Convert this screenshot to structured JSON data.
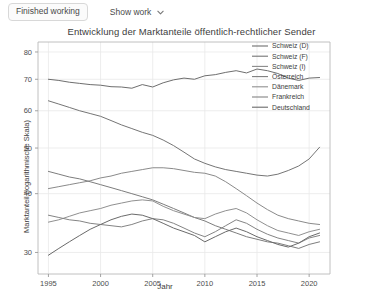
{
  "toolbar": {
    "status_label": "Finished working",
    "show_work_label": "Show work",
    "chevron_icon": "chevron-down-icon"
  },
  "chart_data": {
    "type": "line",
    "title": "Entwicklung der Marktanteile öffentlich-rechtlicher Sender",
    "xlabel": "Jahr",
    "ylabel": "Marktanteil (logarithmische Skala)",
    "yscale": "log",
    "grid": true,
    "legend_position": "top-right",
    "xlim": [
      1994,
      2022
    ],
    "ylim": [
      27,
      84
    ],
    "xticks": [
      1995,
      2000,
      2005,
      2010,
      2015,
      2020
    ],
    "yticks": [
      30,
      40,
      50,
      60,
      70,
      80
    ],
    "x": [
      1995,
      1996,
      1997,
      1998,
      1999,
      2000,
      2001,
      2002,
      2003,
      2004,
      2005,
      2006,
      2007,
      2008,
      2009,
      2010,
      2011,
      2012,
      2013,
      2014,
      2015,
      2016,
      2017,
      2018,
      2019,
      2020,
      2021
    ],
    "series": [
      {
        "name": "Schweiz (D)",
        "color": "#6e6e6e",
        "values": [
          70.0,
          69.6,
          69.0,
          68.6,
          68.2,
          68.0,
          67.5,
          67.4,
          67.0,
          68.2,
          67.4,
          68.8,
          69.8,
          70.4,
          70.0,
          71.2,
          71.6,
          72.4,
          73.0,
          72.2,
          73.6,
          73.0,
          72.0,
          70.4,
          69.6,
          70.4,
          70.6
        ]
      },
      {
        "name": "Schweiz (F)",
        "color": "#757575",
        "values": [
          63.0,
          62.0,
          61.0,
          60.0,
          59.2,
          58.4,
          57.2,
          56.0,
          55.0,
          54.0,
          53.2,
          52.0,
          50.6,
          49.0,
          47.4,
          46.4,
          45.6,
          45.0,
          44.6,
          44.2,
          43.8,
          43.6,
          44.0,
          44.8,
          45.8,
          47.4,
          50.2
        ]
      },
      {
        "name": "Schweiz (I)",
        "color": "#8a8a8a",
        "values": [
          41.0,
          41.4,
          41.8,
          42.2,
          42.6,
          43.2,
          43.6,
          44.2,
          44.6,
          45.0,
          45.4,
          45.4,
          45.2,
          44.8,
          44.4,
          44.2,
          43.6,
          42.4,
          41.0,
          39.6,
          38.2,
          37.0,
          36.0,
          35.4,
          35.0,
          34.6,
          34.4
        ]
      },
      {
        "name": "Österreich",
        "color": "#7d7d7d",
        "values": [
          44.6,
          44.0,
          43.4,
          43.0,
          42.4,
          41.8,
          41.2,
          40.6,
          40.0,
          39.4,
          38.8,
          38.0,
          37.2,
          36.4,
          35.6,
          35.0,
          34.2,
          33.6,
          33.0,
          32.4,
          32.0,
          31.6,
          31.4,
          31.0,
          30.6,
          31.2,
          31.6
        ]
      },
      {
        "name": "Dänemark",
        "color": "#909090",
        "values": [
          34.8,
          35.2,
          35.8,
          36.4,
          36.8,
          37.2,
          37.8,
          38.2,
          38.6,
          38.8,
          38.6,
          37.6,
          36.8,
          36.2,
          35.6,
          35.4,
          36.2,
          36.8,
          37.2,
          36.4,
          35.2,
          34.2,
          33.4,
          33.0,
          32.6,
          33.2,
          33.6
        ]
      },
      {
        "name": "Frankreich",
        "color": "#848484",
        "values": [
          36.0,
          35.6,
          35.2,
          35.0,
          34.6,
          34.4,
          34.2,
          34.0,
          34.4,
          35.0,
          35.4,
          35.2,
          34.6,
          33.8,
          33.0,
          32.4,
          33.2,
          34.2,
          35.2,
          34.6,
          33.6,
          32.8,
          32.2,
          31.8,
          31.4,
          32.2,
          32.6
        ]
      },
      {
        "name": "Deutschland",
        "color": "#6a6a6a",
        "values": [
          29.6,
          30.6,
          31.6,
          32.6,
          33.6,
          34.4,
          35.2,
          35.8,
          36.2,
          36.0,
          35.4,
          34.6,
          33.8,
          33.2,
          32.6,
          31.6,
          32.4,
          33.2,
          33.8,
          33.2,
          32.4,
          31.8,
          31.2,
          30.8,
          31.4,
          32.4,
          33.0
        ]
      }
    ]
  }
}
